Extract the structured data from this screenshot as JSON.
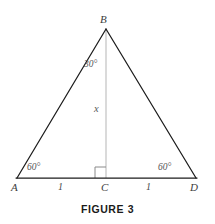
{
  "figure": {
    "caption": "FIGURE 3",
    "vertices": {
      "apex": "B",
      "left": "A",
      "foot": "C",
      "right": "D"
    },
    "angles": {
      "apex_half": "30°",
      "base_left": "60°",
      "base_right": "60°"
    },
    "lengths": {
      "left_segment": "1",
      "right_segment": "1",
      "altitude_variable": "x"
    },
    "colors": {
      "background": "#ffffff",
      "triangle_stroke": "#1c1c1c",
      "altitude_stroke": "#b5b5b5",
      "right_angle_stroke": "#8a8a8a",
      "label_text": "#4a4a4a",
      "caption_text": "#1a1a1a"
    }
  }
}
